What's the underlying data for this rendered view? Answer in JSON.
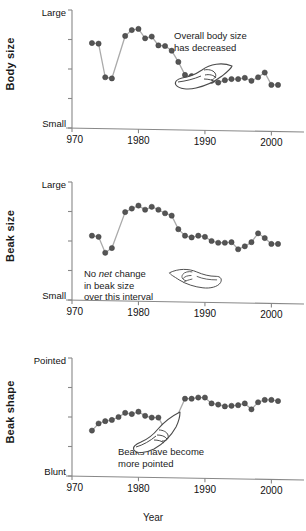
{
  "figure": {
    "xlabel": "Year",
    "xticks": [
      1970,
      1980,
      1990,
      2000
    ],
    "marker_color": "#555555",
    "line_color": "#aaaaaa",
    "axis_color": "#888888"
  },
  "panels": [
    {
      "key": "body-size",
      "ylabel": "Body size",
      "ytop": "Large",
      "ybot": "Small",
      "annotation_line1": "Overall body size",
      "annotation_line2": "has decreased",
      "annotation_emphasis": "",
      "icon": "pointing-hand-icon"
    },
    {
      "key": "beak-size",
      "ylabel": "Beak size",
      "ytop": "Large",
      "ybot": "Small",
      "annotation_line1": "No net change",
      "annotation_line2": "in beak size",
      "annotation_line3": "over this interval",
      "annotation_emphasis": "net",
      "icon": "pointing-hand-icon"
    },
    {
      "key": "beak-shape",
      "ylabel": "Beak shape",
      "ytop": "Pointed",
      "ybot": "Blunt",
      "annotation_line1": "Beaks have become",
      "annotation_line2": "more pointed",
      "annotation_emphasis": "",
      "icon": "pointing-hand-icon"
    }
  ],
  "chart_data": [
    {
      "type": "line",
      "title": "Body size",
      "xlabel": "Year",
      "ylabel": "Body size",
      "ylim": [
        0,
        1
      ],
      "ytick_labels": [
        "Small",
        "",
        "",
        "",
        "Large"
      ],
      "xlim": [
        1970,
        2002
      ],
      "xticks": [
        1970,
        1980,
        1990,
        2000
      ],
      "grid": false,
      "legend": null,
      "x": [
        1973,
        1974,
        1975,
        1976,
        1978,
        1979,
        1980,
        1981,
        1982,
        1983,
        1984,
        1985,
        1986,
        1987,
        1988,
        1989,
        1990,
        1991,
        1992,
        1993,
        1994,
        1995,
        1996,
        1997,
        1998,
        1999,
        2000,
        2001
      ],
      "y": [
        0.72,
        0.715,
        0.43,
        0.42,
        0.78,
        0.83,
        0.84,
        0.76,
        0.775,
        0.7,
        0.695,
        0.655,
        0.56,
        0.45,
        0.44,
        0.445,
        0.435,
        0.4,
        0.385,
        0.405,
        0.415,
        0.415,
        0.425,
        0.4,
        0.43,
        0.47,
        0.365,
        0.365
      ],
      "annotation": "Overall body size has decreased"
    },
    {
      "type": "line",
      "title": "Beak size",
      "xlabel": "Year",
      "ylabel": "Beak size",
      "ylim": [
        0,
        1
      ],
      "ytick_labels": [
        "Small",
        "",
        "",
        "",
        "Large"
      ],
      "xlim": [
        1970,
        2002
      ],
      "xticks": [
        1970,
        1980,
        1990,
        2000
      ],
      "grid": false,
      "legend": null,
      "x": [
        1973,
        1974,
        1975,
        1976,
        1978,
        1979,
        1980,
        1981,
        1982,
        1983,
        1984,
        1985,
        1986,
        1987,
        1988,
        1989,
        1990,
        1991,
        1992,
        1993,
        1994,
        1995,
        1996,
        1997,
        1998,
        1999,
        2000,
        2001
      ],
      "y": [
        0.545,
        0.535,
        0.4,
        0.44,
        0.745,
        0.775,
        0.8,
        0.765,
        0.79,
        0.765,
        0.735,
        0.715,
        0.6,
        0.545,
        0.53,
        0.545,
        0.535,
        0.5,
        0.485,
        0.485,
        0.49,
        0.43,
        0.455,
        0.49,
        0.565,
        0.525,
        0.475,
        0.475
      ],
      "annotation": "No net change in beak size over this interval"
    },
    {
      "type": "line",
      "title": "Beak shape",
      "xlabel": "Year",
      "ylabel": "Beak shape",
      "ylim": [
        0,
        1
      ],
      "ytick_labels": [
        "Blunt",
        "",
        "",
        "",
        "Pointed"
      ],
      "xlim": [
        1970,
        2002
      ],
      "xticks": [
        1970,
        1980,
        1990,
        2000
      ],
      "grid": false,
      "legend": null,
      "x": [
        1973,
        1974,
        1975,
        1976,
        1977,
        1978,
        1979,
        1980,
        1981,
        1982,
        1983,
        1984,
        1985,
        1987,
        1988,
        1989,
        1990,
        1991,
        1992,
        1993,
        1994,
        1995,
        1996,
        1997,
        1998,
        1999,
        2000,
        2001
      ],
      "y": [
        0.385,
        0.445,
        0.465,
        0.475,
        0.5,
        0.535,
        0.525,
        0.545,
        0.51,
        0.495,
        0.495,
        0.395,
        0.405,
        0.655,
        0.655,
        0.665,
        0.665,
        0.615,
        0.605,
        0.59,
        0.595,
        0.6,
        0.615,
        0.565,
        0.625,
        0.645,
        0.645,
        0.635
      ],
      "annotation": "Beaks have become more pointed"
    }
  ]
}
